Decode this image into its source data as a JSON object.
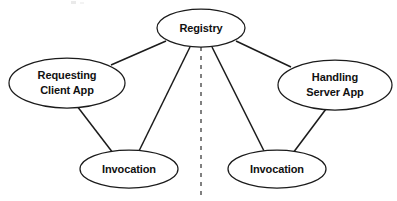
{
  "diagram": {
    "type": "node-link-diagram",
    "background_color": "#ffffff",
    "stroke_color": "#1b1b1b",
    "divider_color": "#808080",
    "nodes": [
      {
        "id": "registry",
        "label": "Registry",
        "lines": [
          "Registry"
        ],
        "cx": 201,
        "cy": 28,
        "rx": 44,
        "ry": 19
      },
      {
        "id": "requesting-client-app",
        "label": "Requesting Client App",
        "lines": [
          "Requesting",
          "Client App"
        ],
        "cx": 67,
        "cy": 83,
        "rx": 58,
        "ry": 25
      },
      {
        "id": "handling-server-app",
        "label": "Handling Server App",
        "lines": [
          "Handling",
          "Server App"
        ],
        "cx": 335,
        "cy": 85,
        "rx": 57,
        "ry": 25
      },
      {
        "id": "invocation-client",
        "label": "Invocation",
        "lines": [
          "Invocation"
        ],
        "cx": 129,
        "cy": 169,
        "rx": 49,
        "ry": 19
      },
      {
        "id": "invocation-server",
        "label": "Invocation",
        "lines": [
          "Invocation"
        ],
        "cx": 277,
        "cy": 169,
        "rx": 49,
        "ry": 19
      }
    ],
    "edges": [
      {
        "id": "registry-to-client-app",
        "from": "registry",
        "to": "requesting-client-app",
        "x1": 166,
        "y1": 41,
        "x2": 111,
        "y2": 65
      },
      {
        "id": "registry-to-server-app",
        "from": "registry",
        "to": "handling-server-app",
        "x1": 236,
        "y1": 41,
        "x2": 291,
        "y2": 67
      },
      {
        "id": "registry-to-invocation-client",
        "from": "registry",
        "to": "invocation-client",
        "x1": 190,
        "y1": 47,
        "x2": 139,
        "y2": 151
      },
      {
        "id": "registry-to-invocation-server",
        "from": "registry",
        "to": "invocation-server",
        "x1": 212,
        "y1": 47,
        "x2": 264,
        "y2": 151
      },
      {
        "id": "client-app-to-invocation-client",
        "from": "requesting-client-app",
        "to": "invocation-client",
        "x1": 77,
        "y1": 106,
        "x2": 113,
        "y2": 153
      },
      {
        "id": "server-app-to-invocation-server",
        "from": "handling-server-app",
        "to": "invocation-server",
        "x1": 326,
        "y1": 109,
        "x2": 293,
        "y2": 153
      }
    ],
    "divider": {
      "id": "client-server-boundary",
      "label": "client-server boundary",
      "x": 201,
      "y1": 47,
      "y2": 196,
      "style": "dashed"
    }
  }
}
